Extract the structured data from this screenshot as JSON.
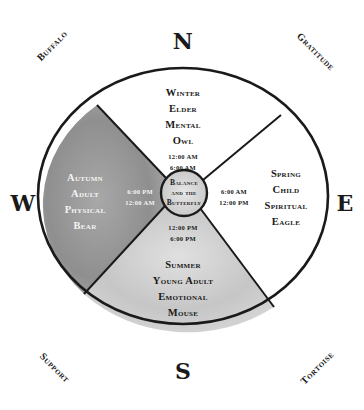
{
  "directions": {
    "north": "N",
    "east": "E",
    "south": "S",
    "west": "W"
  },
  "corners": {
    "northwest": "Buffalo",
    "northeast": "Gratitude",
    "southwest": "Support",
    "southeast": "Tortoise"
  },
  "quadrants": {
    "north": {
      "season": "Winter",
      "stage": "Elder",
      "aspect": "Mental",
      "animal": "Owl",
      "time_start": "12:00 AM",
      "time_end": "6:00 AM"
    },
    "east": {
      "season": "Spring",
      "stage": "Child",
      "aspect": "Spiritual",
      "animal": "Eagle",
      "time_start": "6:00 AM",
      "time_end": "12:00 PM"
    },
    "south": {
      "season": "Summer",
      "stage": "Young Adult",
      "aspect": "Emotional",
      "animal": "Mouse",
      "time_start": "12:00 PM",
      "time_end": "6:00 PM"
    },
    "west": {
      "season": "Autumn",
      "stage": "Adult",
      "aspect": "Physical",
      "animal": "Bear",
      "time_start": "6:00 PM",
      "time_end": "12:00 AM"
    }
  },
  "center": {
    "line1": "Balance",
    "line2": "and the",
    "line3": "Butterfly"
  },
  "colors": {
    "outline": "#1a1a1a",
    "shade_west": "#9a9a9a",
    "shade_south": "#c9c9c9",
    "center_fill": "#dcdcdc"
  }
}
